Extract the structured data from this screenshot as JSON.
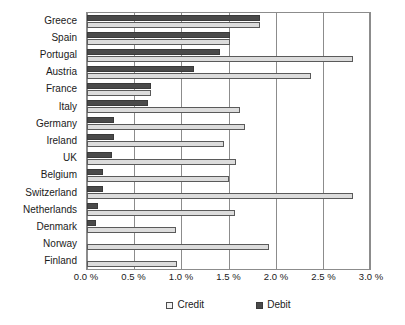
{
  "chart_data": {
    "type": "bar",
    "orientation": "horizontal",
    "title": "",
    "subtitle": "",
    "xlabel": "",
    "ylabel": "",
    "xlim": [
      0.0,
      3.0
    ],
    "grid": true,
    "grid_axis": "x",
    "legend_position": "bottom",
    "categories": [
      "Greece",
      "Spain",
      "Portugal",
      "Austria",
      "France",
      "Italy",
      "Germany",
      "Ireland",
      "UK",
      "Belgium",
      "Switzerland",
      "Netherlands",
      "Denmark",
      "Norway",
      "Finland"
    ],
    "series": [
      {
        "name": "Debit",
        "color": "#4a4a4a",
        "values": [
          1.83,
          1.52,
          1.41,
          1.13,
          0.68,
          0.65,
          0.29,
          0.29,
          0.26,
          0.17,
          0.17,
          0.12,
          0.1,
          0.0,
          0.0
        ]
      },
      {
        "name": "Credit",
        "color": "#dcdcdc",
        "values": [
          1.83,
          1.52,
          2.82,
          2.37,
          0.68,
          1.62,
          1.68,
          1.45,
          1.58,
          1.5,
          2.82,
          1.57,
          0.94,
          1.93,
          0.95
        ]
      }
    ],
    "x_ticks": [
      {
        "value": 0.0,
        "label": "0.0 %"
      },
      {
        "value": 0.5,
        "label": "0.5 %"
      },
      {
        "value": 1.0,
        "label": "1.0 %"
      },
      {
        "value": 1.5,
        "label": "1.5 %"
      },
      {
        "value": 2.0,
        "label": "2.0 %"
      },
      {
        "value": 2.5,
        "label": "2.5 %"
      },
      {
        "value": 3.0,
        "label": "3.0 %"
      }
    ],
    "legend": [
      {
        "label": "Credit",
        "swatch": "credit"
      },
      {
        "label": "Debit",
        "swatch": "debit"
      }
    ]
  }
}
